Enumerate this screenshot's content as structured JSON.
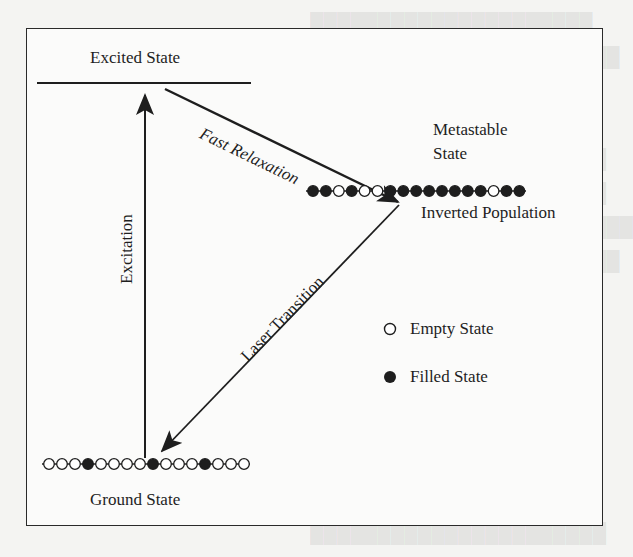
{
  "figure": {
    "type": "energy-level diagram (laser population inversion)",
    "levels": {
      "excited": {
        "label": "Excited State"
      },
      "metastable": {
        "label_line1": "Metastable",
        "label_line2": "State",
        "population_label": "Inverted Population",
        "dots": [
          "filled",
          "filled",
          "empty",
          "filled",
          "empty",
          "empty",
          "filled",
          "filled",
          "filled",
          "filled",
          "filled",
          "filled",
          "filled",
          "filled",
          "empty",
          "filled",
          "filled"
        ]
      },
      "ground": {
        "label": "Ground State",
        "dots": [
          "empty",
          "empty",
          "empty",
          "filled",
          "empty",
          "empty",
          "empty",
          "empty",
          "filled",
          "empty",
          "empty",
          "empty",
          "filled",
          "empty",
          "empty",
          "empty"
        ]
      }
    },
    "transitions": [
      {
        "id": "excitation",
        "label": "Excitation",
        "from": "ground",
        "to": "excited"
      },
      {
        "id": "fast-relaxation",
        "label": "Fast Relaxation",
        "from": "excited",
        "to": "metastable"
      },
      {
        "id": "laser-transition",
        "label": "Laser Transition",
        "from": "metastable",
        "to": "ground"
      }
    ],
    "legend": [
      {
        "symbol": "empty-circle",
        "label": "Empty State"
      },
      {
        "symbol": "filled-circle",
        "label": "Filled State"
      }
    ],
    "colors": {
      "ink": "#1e1e1e",
      "paper": "#fbfbfa",
      "background": "#f4f4f2"
    }
  }
}
